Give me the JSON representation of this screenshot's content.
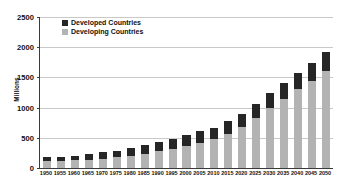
{
  "chart_data": {
    "type": "bar",
    "stacked": true,
    "title": "",
    "subtitle": "",
    "xlabel": "",
    "ylabel": "Millions",
    "ylim": [
      0,
      2500
    ],
    "yticks": [
      0,
      500,
      1000,
      1500,
      2000,
      2500
    ],
    "grid": true,
    "legend_position": "top-left",
    "categories": [
      "1950",
      "1955",
      "1960",
      "1965",
      "1970",
      "1975",
      "1980",
      "1985",
      "1990",
      "1995",
      "2000",
      "2005",
      "2010",
      "2015",
      "2020",
      "2025",
      "2030",
      "2035",
      "2040",
      "2045",
      "2050"
    ],
    "series": [
      {
        "name": "Developing Countries",
        "color": "#b3b3b3",
        "values": [
          110,
          118,
          128,
          140,
          155,
          175,
          200,
          235,
          275,
          320,
          370,
          420,
          480,
          570,
          680,
          830,
          1000,
          1150,
          1300,
          1440,
          1610
        ]
      },
      {
        "name": "Developed Countries",
        "color": "#262626",
        "values": [
          70,
          70,
          78,
          90,
          105,
          115,
          125,
          145,
          155,
          165,
          175,
          185,
          190,
          205,
          215,
          235,
          250,
          265,
          280,
          300,
          310
        ]
      }
    ],
    "totals": [
      180,
      188,
      206,
      230,
      260,
      290,
      325,
      380,
      430,
      485,
      545,
      605,
      670,
      775,
      895,
      1065,
      1250,
      1415,
      1580,
      1740,
      1920
    ]
  },
  "legend": {
    "items": [
      {
        "label": "Developed Countries",
        "color": "#262626"
      },
      {
        "label": "Developing Countries",
        "color": "#b3b3b3"
      }
    ]
  },
  "axes": {
    "y_title": "Millions"
  }
}
